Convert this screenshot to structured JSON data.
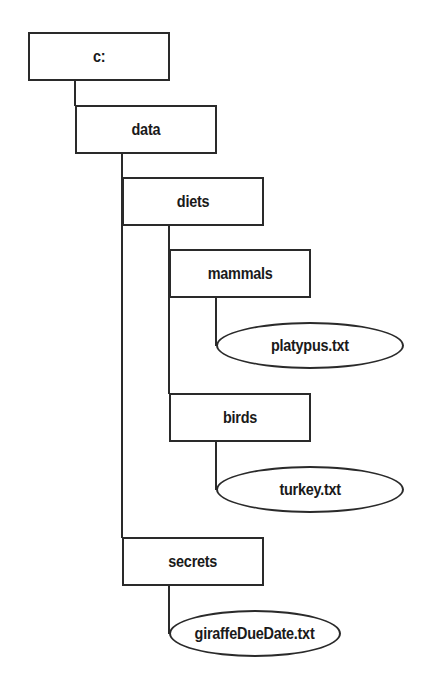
{
  "diagram": {
    "type": "directory-tree",
    "colors": {
      "stroke": "#2a2a2a",
      "text": "#1a1a1a",
      "background": "#ffffff"
    },
    "nodes": {
      "root": {
        "label": "c:",
        "kind": "folder"
      },
      "data": {
        "label": "data",
        "kind": "folder"
      },
      "diets": {
        "label": "diets",
        "kind": "folder"
      },
      "mammals": {
        "label": "mammals",
        "kind": "folder"
      },
      "platypus": {
        "label": "platypus.txt",
        "kind": "file"
      },
      "birds": {
        "label": "birds",
        "kind": "folder"
      },
      "turkey": {
        "label": "turkey.txt",
        "kind": "file"
      },
      "secrets": {
        "label": "secrets",
        "kind": "folder"
      },
      "giraffe": {
        "label": "giraffeDueDate.txt",
        "kind": "file"
      }
    },
    "edges": [
      [
        "root",
        "data"
      ],
      [
        "data",
        "diets"
      ],
      [
        "data",
        "secrets"
      ],
      [
        "diets",
        "mammals"
      ],
      [
        "diets",
        "birds"
      ],
      [
        "mammals",
        "platypus"
      ],
      [
        "birds",
        "turkey"
      ],
      [
        "secrets",
        "giraffe"
      ]
    ]
  }
}
